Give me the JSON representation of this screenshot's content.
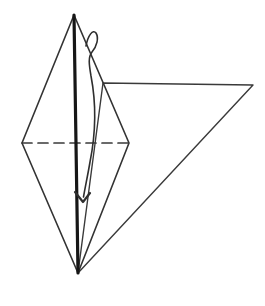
{
  "canvas": {
    "width": 265,
    "height": 306,
    "background": "#ffffff"
  },
  "colors": {
    "thin_line": "#3a3a3a",
    "thick_line": "#161616",
    "arrow_line": "#2e2e2e",
    "background": "#ffffff"
  },
  "diagram": {
    "kind": "origami-fold-step",
    "shapes": [
      {
        "name": "flap-triangle",
        "type": "polygon",
        "points": [
          [
            103,
            83
          ],
          [
            253,
            85
          ],
          [
            78,
            273
          ]
        ],
        "stroke": "#3a3a3a",
        "width": 1.4,
        "fill": "none"
      },
      {
        "name": "kite-outline",
        "type": "polygon",
        "points": [
          [
            74,
            15
          ],
          [
            129,
            143
          ],
          [
            78,
            273
          ],
          [
            22,
            143
          ]
        ],
        "stroke": "#333333",
        "width": 1.6,
        "fill": "none"
      },
      {
        "name": "fold-line-dashed",
        "type": "line",
        "points": [
          [
            22,
            143
          ],
          [
            129,
            143
          ]
        ],
        "stroke": "#3a3a3a",
        "width": 1.7,
        "dash": "10 6",
        "fill": "none"
      },
      {
        "name": "center-spine",
        "type": "line",
        "points": [
          [
            74,
            15
          ],
          [
            78,
            273
          ]
        ],
        "stroke": "#161616",
        "width": 3.2,
        "fill": "none"
      },
      {
        "name": "fold-arrow-curve",
        "type": "path",
        "d": "M 86 46 C 88 35, 93 29, 96 33 C 99 38, 97 46, 92 52 C 88 57, 89 64, 91 76 C 96 102, 96 132, 90 162 C 88 174, 85 188, 83.5 197",
        "stroke": "#2e2e2e",
        "width": 1.6,
        "fill": "none"
      },
      {
        "name": "fold-arrow-head",
        "type": "path",
        "d": "M 75 192 L 83 202 L 90 193",
        "stroke": "#2e2e2e",
        "width": 2.2,
        "fill": "none"
      }
    ]
  }
}
